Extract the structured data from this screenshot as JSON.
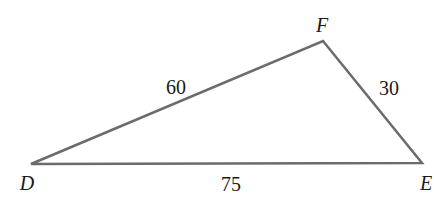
{
  "diagram": {
    "type": "triangle",
    "stroke_color": "#6b6b6b",
    "vertices": [
      {
        "name": "D",
        "x": 31,
        "y": 164,
        "label_x": 27,
        "label_y": 190
      },
      {
        "name": "F",
        "x": 323,
        "y": 41,
        "label_x": 322,
        "label_y": 32
      },
      {
        "name": "E",
        "x": 422,
        "y": 163,
        "label_x": 426,
        "label_y": 190
      }
    ],
    "sides": [
      {
        "between": "DF",
        "length": "60",
        "label_x": 176,
        "label_y": 94
      },
      {
        "between": "FE",
        "length": "30",
        "label_x": 389,
        "label_y": 95
      },
      {
        "between": "DE",
        "length": "75",
        "label_x": 231,
        "label_y": 191
      }
    ]
  }
}
